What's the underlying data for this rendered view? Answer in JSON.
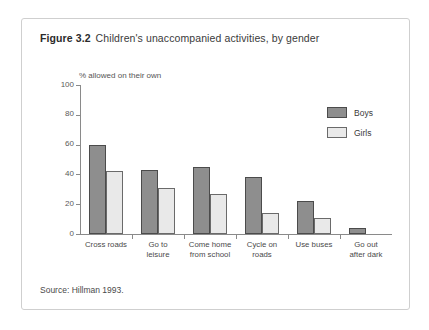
{
  "figure": {
    "number": "Figure 3.2",
    "title": "Children's unaccompanied activities, by gender",
    "source": "Source: Hillman 1993."
  },
  "chart_data": {
    "type": "bar",
    "title": "Children's unaccompanied activities, by gender",
    "xlabel": "",
    "ylabel": "% allowed on their own",
    "ylim": [
      0,
      100
    ],
    "yticks": [
      0,
      20,
      40,
      60,
      80,
      100
    ],
    "grid": false,
    "legend_position": "top-right",
    "categories": [
      "Cross roads",
      "Go to leisure",
      "Come home from school",
      "Cycle on roads",
      "Use buses",
      "Go out after dark"
    ],
    "category_lines": [
      [
        "Cross roads"
      ],
      [
        "Go to",
        "leisure"
      ],
      [
        "Come home",
        "from school"
      ],
      [
        "Cycle on",
        "roads"
      ],
      [
        "Use buses"
      ],
      [
        "Go out",
        "after dark"
      ]
    ],
    "series": [
      {
        "name": "Boys",
        "color": "#8e8e8e",
        "values": [
          60,
          43,
          45,
          38,
          22,
          4
        ]
      },
      {
        "name": "Girls",
        "color": "#e9e9e9",
        "values": [
          42,
          31,
          27,
          14,
          11,
          0
        ]
      }
    ]
  }
}
